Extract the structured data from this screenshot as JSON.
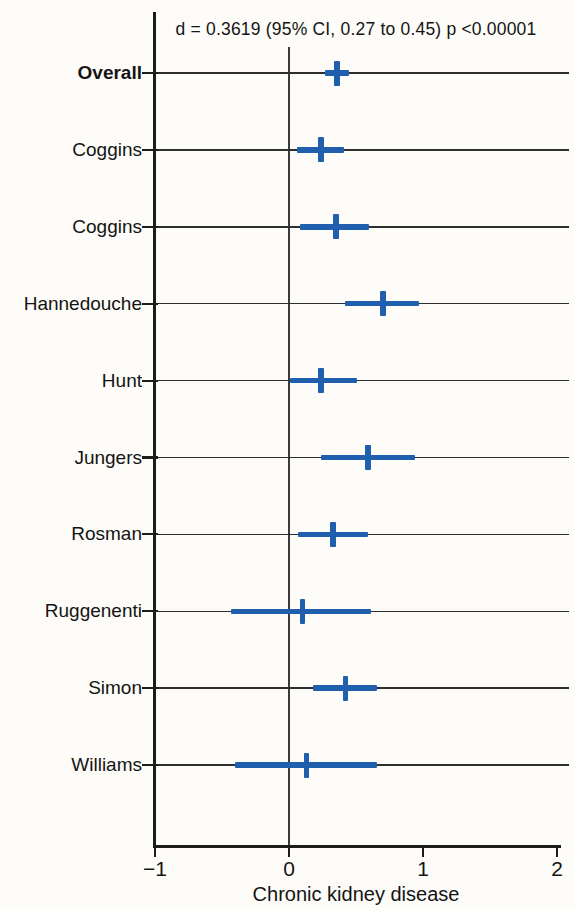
{
  "colors": {
    "marker_blue": "#1f5fad",
    "axis_black": "#1c1c1c",
    "background": "#fdfcf8"
  },
  "chart_data": {
    "type": "forest",
    "title": "d = 0.3619 (95% CI, 0.27 to 0.45) p <0.00001",
    "xlabel": "Chronic kidney disease",
    "xlim": [
      -1,
      2
    ],
    "xticks": [
      {
        "value": -1,
        "label": "−1"
      },
      {
        "value": 0,
        "label": "0"
      },
      {
        "value": 1,
        "label": "1"
      },
      {
        "value": 2,
        "label": "2"
      }
    ],
    "reference_line_x": 0,
    "grid": "horizontal-row-lines",
    "legend_position": "none",
    "studies": [
      {
        "label": "Overall",
        "bold": true,
        "d": 0.36,
        "ci_low": 0.27,
        "ci_high": 0.45
      },
      {
        "label": "Coggins",
        "bold": false,
        "d": 0.24,
        "ci_low": 0.06,
        "ci_high": 0.41
      },
      {
        "label": "Coggins",
        "bold": false,
        "d": 0.35,
        "ci_low": 0.08,
        "ci_high": 0.6
      },
      {
        "label": "Hannedouche",
        "bold": false,
        "d": 0.7,
        "ci_low": 0.42,
        "ci_high": 0.97
      },
      {
        "label": "Hunt",
        "bold": false,
        "d": 0.24,
        "ci_low": 0.01,
        "ci_high": 0.51
      },
      {
        "label": "Jungers",
        "bold": false,
        "d": 0.59,
        "ci_low": 0.24,
        "ci_high": 0.94
      },
      {
        "label": "Rosman",
        "bold": false,
        "d": 0.33,
        "ci_low": 0.07,
        "ci_high": 0.59
      },
      {
        "label": "Ruggenenti",
        "bold": false,
        "d": 0.1,
        "ci_low": -0.43,
        "ci_high": 0.61
      },
      {
        "label": "Simon",
        "bold": false,
        "d": 0.42,
        "ci_low": 0.18,
        "ci_high": 0.66
      },
      {
        "label": "Williams",
        "bold": false,
        "d": 0.13,
        "ci_low": -0.4,
        "ci_high": 0.66
      }
    ]
  }
}
